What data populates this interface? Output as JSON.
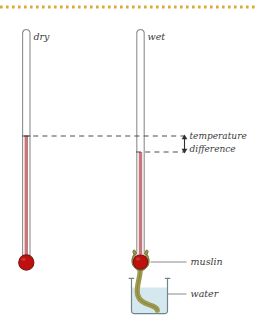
{
  "figure": {
    "border": {
      "style": "dotted",
      "color": "#d9a93a",
      "position": "top"
    },
    "colors": {
      "tube_outline": "#8a8a8a",
      "mercury": "#c0666b",
      "bulb_fill": "#c20f0f",
      "bulb_outline": "#7a1111",
      "muslin": "#9e9b4e",
      "muslin_outline": "#6e6b2e",
      "water": "#d6e8ef",
      "beaker_outline": "#7a8c92",
      "dashed_line": "#4a4a4a",
      "leader_line": "#7a7a7a",
      "text": "#3b3b3b"
    },
    "labels": {
      "dry": "dry",
      "wet": "wet",
      "temperature": "temperature",
      "difference": "difference",
      "muslin": "muslin",
      "water": "water"
    },
    "thermometers": [
      {
        "name": "dry-bulb-thermometer",
        "label": "dry",
        "reading_level_px": 136,
        "bulb": "plain"
      },
      {
        "name": "wet-bulb-thermometer",
        "label": "wet",
        "reading_level_px": 152,
        "bulb": "muslin-wrapped"
      }
    ],
    "annotation": {
      "name": "temperature-difference",
      "arrow": "double-headed-vertical",
      "upper_level_px": 136,
      "lower_level_px": 152
    }
  }
}
